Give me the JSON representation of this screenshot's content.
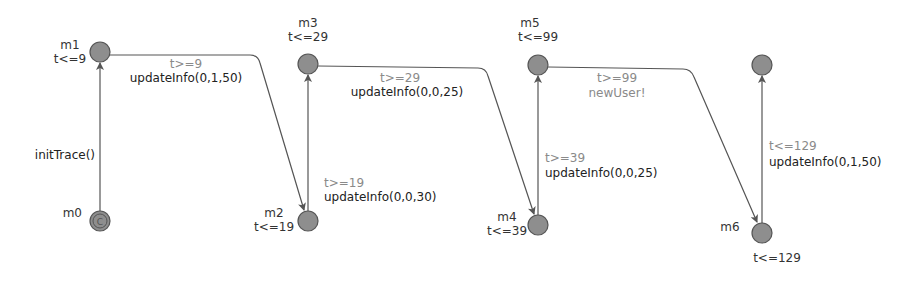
{
  "diagram": {
    "type": "timed-automaton",
    "colors": {
      "state_fill": "#8e8e8e",
      "state_stroke": "#5a5a5a",
      "edge": "#555555",
      "guard_text": "#8a8a8a",
      "label_text": "#222222"
    },
    "states": [
      {
        "id": "m0",
        "name": "m0",
        "invariant": "",
        "initial": true,
        "committed": true,
        "x": 100,
        "y": 221
      },
      {
        "id": "m1",
        "name": "m1",
        "invariant": "t<=9",
        "x": 100,
        "y": 52
      },
      {
        "id": "m2",
        "name": "m2",
        "invariant": "t<=19",
        "x": 308,
        "y": 221
      },
      {
        "id": "m3",
        "name": "m3",
        "invariant": "t<=29",
        "x": 308,
        "y": 64
      },
      {
        "id": "m4",
        "name": "m4",
        "invariant": "t<=39",
        "x": 538,
        "y": 225
      },
      {
        "id": "m5",
        "name": "m5",
        "invariant": "t<=99",
        "x": 538,
        "y": 65
      },
      {
        "id": "m6",
        "name": "m6",
        "invariant": "t<=129",
        "x": 762,
        "y": 233
      },
      {
        "id": "m7",
        "name": "",
        "invariant": "",
        "x": 762,
        "y": 65
      }
    ],
    "transitions": [
      {
        "from": "m0",
        "to": "m1",
        "guard": "",
        "action": "initTrace()"
      },
      {
        "from": "m1",
        "to": "m2",
        "guard": "t>=9",
        "action": "updateInfo(0,1,50)"
      },
      {
        "from": "m2",
        "to": "m3",
        "guard": "t>=19",
        "action": "updateInfo(0,0,30)"
      },
      {
        "from": "m3",
        "to": "m4",
        "guard": "t>=29",
        "action": "updateInfo(0,0,25)"
      },
      {
        "from": "m4",
        "to": "m5",
        "guard": "t>=39",
        "action": "updateInfo(0,0,25)"
      },
      {
        "from": "m5",
        "to": "m6",
        "guard": "t>=99",
        "action": "newUser!"
      },
      {
        "from": "m6",
        "to": "m7",
        "guard": "t<=129",
        "action": "updateInfo(0,1,50)"
      }
    ]
  }
}
